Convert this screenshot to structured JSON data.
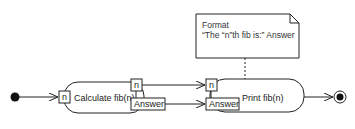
{
  "diagram": {
    "type": "UML activity diagram",
    "note": {
      "line1": "Format",
      "line2": "“The “n”th fib is:” Answer"
    },
    "actions": [
      {
        "label": "Calculate fib(n)",
        "input_pins": [
          "n"
        ],
        "output_pins": [
          "n",
          "Answer"
        ]
      },
      {
        "label": "Print fib(n)",
        "input_pins": [
          "n",
          "Answer"
        ]
      }
    ],
    "initial_node": "initial",
    "final_node": "final"
  }
}
